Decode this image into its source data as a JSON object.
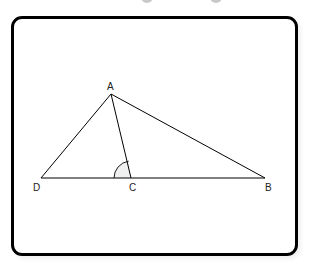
{
  "diagram": {
    "type": "geometry-triangle",
    "points": {
      "A": {
        "label": "A",
        "x": 111,
        "y": 94
      },
      "B": {
        "label": "B",
        "x": 265,
        "y": 178
      },
      "C": {
        "label": "C",
        "x": 131,
        "y": 178
      },
      "D": {
        "label": "D",
        "x": 41,
        "y": 178
      }
    },
    "segments": [
      "AD",
      "AB",
      "AC",
      "DB"
    ],
    "angle_marker": {
      "vertex": "C",
      "between": [
        "CD",
        "CA"
      ],
      "radius": 17,
      "fill": "#f0f0f0"
    },
    "colors": {
      "stroke": "#000000",
      "frame": "#000000",
      "background": "#ffffff"
    }
  }
}
